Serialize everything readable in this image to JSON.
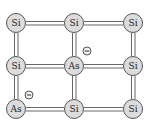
{
  "diagram": {
    "colors": {
      "atom_fill": "#dcdcdc",
      "atom_stroke": "#555555",
      "bond": "#666666",
      "text": "#222222"
    },
    "atoms": [
      {
        "id": "r0c0",
        "label": "Si",
        "x": 16,
        "y": 23
      },
      {
        "id": "r0c1",
        "label": "Si",
        "x": 74,
        "y": 23
      },
      {
        "id": "r0c2",
        "label": "Si",
        "x": 133,
        "y": 23
      },
      {
        "id": "r1c0",
        "label": "Si",
        "x": 16,
        "y": 66
      },
      {
        "id": "r1c1",
        "label": "As",
        "x": 74,
        "y": 66
      },
      {
        "id": "r1c2",
        "label": "Si",
        "x": 133,
        "y": 66
      },
      {
        "id": "r2c0",
        "label": "As",
        "x": 16,
        "y": 109
      },
      {
        "id": "r2c1",
        "label": "Si",
        "x": 74,
        "y": 109
      },
      {
        "id": "r2c2",
        "label": "Si",
        "x": 133,
        "y": 109
      }
    ],
    "charges": [
      {
        "id": "electron-1",
        "label": "⊖",
        "x": 87,
        "y": 51
      },
      {
        "id": "electron-2",
        "label": "⊖",
        "x": 29,
        "y": 95
      }
    ]
  }
}
